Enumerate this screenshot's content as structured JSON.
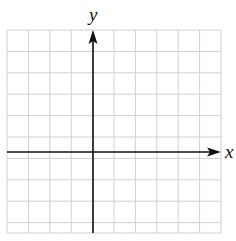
{
  "diagram": {
    "type": "coordinate-plane",
    "x_axis_label": "x",
    "y_axis_label": "y",
    "grid": {
      "left": 7,
      "top": 30,
      "right": 221,
      "bottom": 233,
      "columns": 10,
      "cell_size": 21.4,
      "line_color": "#d0d0d0"
    },
    "axes": {
      "color": "#111111",
      "x_axis_y": 152,
      "y_axis_x": 93
    }
  }
}
